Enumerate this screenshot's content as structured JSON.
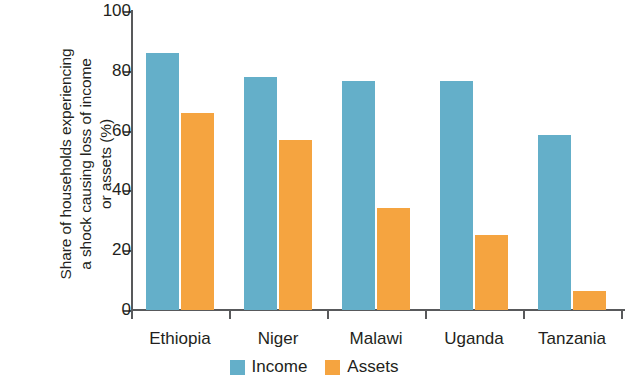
{
  "chart_data": {
    "type": "bar",
    "title": "",
    "subtitle": "",
    "xlabel": "",
    "ylabel": "Share of households experiencing\na shock causing loss of income\nor assets (%)",
    "categories": [
      "Ethiopia",
      "Niger",
      "Malawi",
      "Uganda",
      "Tanzania"
    ],
    "series": [
      {
        "name": "Income",
        "color": "#64afc9",
        "values": [
          86,
          78,
          76.5,
          76.5,
          58.5
        ]
      },
      {
        "name": "Assets",
        "color": "#f5a440",
        "values": [
          66,
          57,
          34,
          25,
          6.5
        ]
      }
    ],
    "ylim": [
      0,
      100
    ],
    "ytick_values": [
      0,
      20,
      40,
      60,
      80,
      100
    ],
    "ytick_labels": [
      "0",
      "20",
      "40",
      "60",
      "80",
      "100"
    ],
    "grid": false,
    "legend_position": "bottom-center",
    "axis_color": "#58595b",
    "background_color": "#ffffff"
  }
}
